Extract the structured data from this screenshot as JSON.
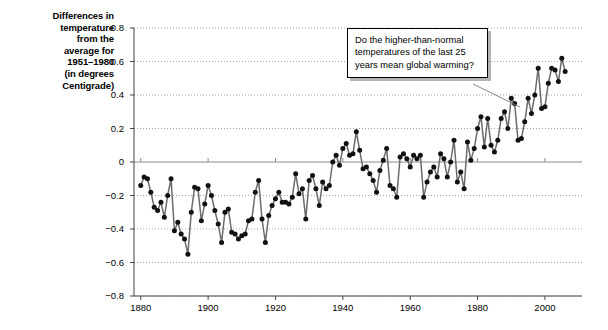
{
  "chart_data": {
    "type": "line",
    "title": "",
    "ylabel_lines": [
      "Differences in",
      "temperature",
      "from the",
      "average for",
      "1951–1980",
      "(in degrees",
      "Centigrade)"
    ],
    "ylabel": "Differences in temperature from the average for 1951-1980 (in degrees Centigrade)",
    "xlabel": "",
    "xlim": [
      1878,
      2011
    ],
    "ylim": [
      -0.8,
      0.8
    ],
    "xticks": [
      1880,
      1900,
      1920,
      1940,
      1960,
      1980,
      2000
    ],
    "xtick_labels": [
      "1880",
      "1900",
      "1920",
      "1940",
      "1960",
      "1980",
      "2000"
    ],
    "yticks": [
      0.8,
      0.6,
      0.4,
      0.2,
      0,
      -0.2,
      -0.4,
      -0.6,
      -0.8
    ],
    "ytick_labels": [
      "0.8",
      "0.6",
      "0.4",
      "0.2",
      "0",
      "−0.2",
      "−0.4",
      "−0.6",
      "−0.8"
    ],
    "grid": "dotted-horizontal",
    "zero_line": true,
    "legend": "none",
    "marker": "filled-circle",
    "line_color": "#6b6b6b",
    "marker_color": "#111111",
    "x": [
      1880,
      1881,
      1882,
      1883,
      1884,
      1885,
      1886,
      1887,
      1888,
      1889,
      1890,
      1891,
      1892,
      1893,
      1894,
      1895,
      1896,
      1897,
      1898,
      1899,
      1900,
      1901,
      1902,
      1903,
      1904,
      1905,
      1906,
      1907,
      1908,
      1909,
      1910,
      1911,
      1912,
      1913,
      1914,
      1915,
      1916,
      1917,
      1918,
      1919,
      1920,
      1921,
      1922,
      1923,
      1924,
      1925,
      1926,
      1927,
      1928,
      1929,
      1930,
      1931,
      1932,
      1933,
      1934,
      1935,
      1936,
      1937,
      1938,
      1939,
      1940,
      1941,
      1942,
      1943,
      1944,
      1945,
      1946,
      1947,
      1948,
      1949,
      1950,
      1951,
      1952,
      1953,
      1954,
      1955,
      1956,
      1957,
      1958,
      1959,
      1960,
      1961,
      1962,
      1963,
      1964,
      1965,
      1966,
      1967,
      1968,
      1969,
      1970,
      1971,
      1972,
      1973,
      1974,
      1975,
      1976,
      1977,
      1978,
      1979,
      1980,
      1981,
      1982,
      1983,
      1984,
      1985,
      1986,
      1987,
      1988,
      1989,
      1990,
      1991,
      1992,
      1993,
      1994,
      1995,
      1996,
      1997,
      1998,
      1999,
      2000,
      2001,
      2002,
      2003,
      2004,
      2005,
      2006
    ],
    "values": [
      -0.14,
      -0.09,
      -0.1,
      -0.18,
      -0.27,
      -0.29,
      -0.24,
      -0.33,
      -0.2,
      -0.1,
      -0.41,
      -0.36,
      -0.43,
      -0.46,
      -0.55,
      -0.3,
      -0.15,
      -0.16,
      -0.35,
      -0.25,
      -0.14,
      -0.2,
      -0.29,
      -0.37,
      -0.48,
      -0.3,
      -0.28,
      -0.42,
      -0.43,
      -0.46,
      -0.44,
      -0.43,
      -0.35,
      -0.34,
      -0.18,
      -0.11,
      -0.34,
      -0.48,
      -0.32,
      -0.26,
      -0.22,
      -0.18,
      -0.24,
      -0.24,
      -0.25,
      -0.21,
      -0.07,
      -0.19,
      -0.16,
      -0.34,
      -0.11,
      -0.08,
      -0.16,
      -0.26,
      -0.12,
      -0.16,
      -0.14,
      0.0,
      0.04,
      -0.02,
      0.08,
      0.11,
      0.04,
      0.05,
      0.18,
      0.07,
      -0.04,
      -0.03,
      -0.07,
      -0.11,
      -0.18,
      -0.05,
      0.01,
      0.08,
      -0.14,
      -0.16,
      -0.21,
      0.03,
      0.05,
      0.02,
      -0.03,
      0.04,
      0.02,
      0.04,
      -0.21,
      -0.12,
      -0.06,
      -0.03,
      -0.09,
      0.05,
      0.02,
      -0.09,
      0.0,
      0.13,
      -0.12,
      -0.06,
      -0.16,
      0.12,
      0.01,
      0.08,
      0.2,
      0.27,
      0.09,
      0.26,
      0.1,
      0.06,
      0.13,
      0.26,
      0.3,
      0.2,
      0.38,
      0.35,
      0.13,
      0.14,
      0.24,
      0.38,
      0.29,
      0.4,
      0.56,
      0.32,
      0.33,
      0.47,
      0.56,
      0.55,
      0.48,
      0.62,
      0.54
    ]
  },
  "callout": {
    "text": "Do the higher-than-normal temperatures of the last 25 years mean global warming?"
  }
}
